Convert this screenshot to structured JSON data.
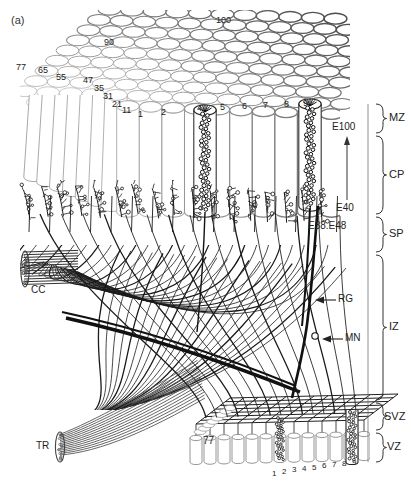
{
  "figure": {
    "panel_label": "(a)",
    "type": "schematic-diagram"
  },
  "zones": {
    "bracket_labels": [
      {
        "id": "MZ",
        "label": "MZ",
        "name": "marginal-zone",
        "y_top": 104,
        "y_bottom": 133
      },
      {
        "id": "CP",
        "label": "CP",
        "name": "cortical-plate",
        "y_top": 136,
        "y_bottom": 214
      },
      {
        "id": "SP",
        "label": "SP",
        "name": "subplate",
        "y_top": 217,
        "y_bottom": 252
      },
      {
        "id": "IZ",
        "label": "IZ",
        "name": "intermediate-zone",
        "y_top": 255,
        "y_bottom": 400
      },
      {
        "id": "SVZ",
        "label": "SVZ",
        "name": "subventricular-zone",
        "y_top": 403,
        "y_bottom": 430
      },
      {
        "id": "VZ",
        "label": "VZ",
        "name": "ventricular-zone",
        "y_top": 433,
        "y_bottom": 462
      }
    ]
  },
  "embryonic_days": {
    "top": "E100",
    "bottom": "E40",
    "subplate": "E38.E48",
    "arrow_direction": "up"
  },
  "structure_labels": [
    {
      "id": "RG",
      "label": "RG",
      "meaning": "radial glia",
      "x": 338,
      "y": 300,
      "arrow": "left"
    },
    {
      "id": "MN",
      "label": "MN",
      "meaning": "migrating neuron",
      "x": 345,
      "y": 339,
      "arrow": "left"
    },
    {
      "id": "CC",
      "label": "CC",
      "meaning": "corpus callosum",
      "x": 31,
      "y": 291,
      "arrow": "none"
    },
    {
      "id": "TR",
      "label": "TR",
      "meaning": "thalamic radiation",
      "x": 36,
      "y": 447,
      "arrow": "none"
    }
  ],
  "radial_unit_numbers": {
    "left_oblique": [
      "77",
      "65",
      "55",
      "47",
      "35",
      "31",
      "21",
      "11"
    ],
    "top_surface": [
      "90",
      "100"
    ],
    "front_row": [
      "1",
      "2",
      "4",
      "5",
      "6",
      "7",
      "8",
      "9"
    ],
    "ventricular_row": [
      "1",
      "2",
      "3",
      "4",
      "5",
      "6",
      "7",
      "8",
      "9"
    ],
    "vz_unit": "77"
  },
  "colors": {
    "ink": "#1a1a1a",
    "light_outline": "#9a9a9a",
    "mid_outline": "#666666",
    "dark_fiber": "#222222",
    "background": "#ffffff"
  }
}
